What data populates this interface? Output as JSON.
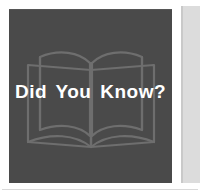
{
  "graphic": {
    "type": "callout-badge",
    "headline": "Did You Know?",
    "icon_name": "open-book-icon",
    "colors": {
      "panel_background": "#4a4a4a",
      "headline_text": "#ffffff",
      "book_outline": "#6e6e6e",
      "side_column": "#dcdcdc",
      "side_column_edge": "#c9c9c9",
      "page_background": "#ffffff",
      "bottom_rule": "#d9d9d9"
    }
  }
}
